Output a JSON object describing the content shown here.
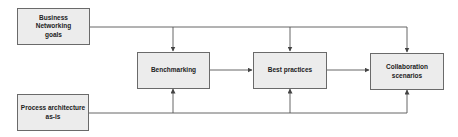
{
  "diagram": {
    "type": "flowchart",
    "nodes": [
      {
        "id": "goals",
        "label": "Business\nNetworking\ngoals"
      },
      {
        "id": "process",
        "label": "Process architecture\nas-is"
      },
      {
        "id": "benchmarking",
        "label": "Benchmarking"
      },
      {
        "id": "best_practices",
        "label": "Best practices"
      },
      {
        "id": "collab",
        "label": "Collaboration\nscenarios"
      }
    ],
    "edges": [
      {
        "from": "goals",
        "to": "benchmarking"
      },
      {
        "from": "goals",
        "to": "best_practices"
      },
      {
        "from": "goals",
        "to": "collab"
      },
      {
        "from": "process",
        "to": "benchmarking"
      },
      {
        "from": "process",
        "to": "best_practices"
      },
      {
        "from": "process",
        "to": "collab"
      },
      {
        "from": "benchmarking",
        "to": "best_practices"
      },
      {
        "from": "best_practices",
        "to": "collab"
      }
    ],
    "colors": {
      "box_fill": "#ececec",
      "box_border": "#6a6a6a",
      "line": "#555555",
      "text": "#222222"
    }
  }
}
